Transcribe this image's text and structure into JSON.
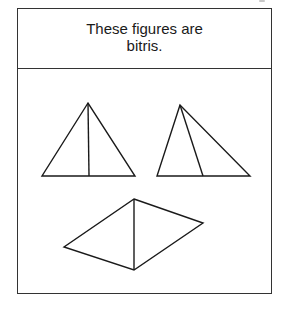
{
  "header": {
    "line1": "These figures are",
    "line2": "bitris."
  },
  "colors": {
    "stroke": "#1a1a1a",
    "border": "#333333",
    "background": "#ffffff"
  },
  "figures": [
    {
      "name": "isosceles-triangle-with-median",
      "description": "Triangle divided by a vertical line from apex to base midpoint into two triangles"
    },
    {
      "name": "scalene-triangle-with-cevian",
      "description": "Triangle divided by a line from apex to base into two triangles"
    },
    {
      "name": "rhombus-with-diagonal",
      "description": "Quadrilateral divided by a vertical diagonal into two triangles"
    }
  ]
}
